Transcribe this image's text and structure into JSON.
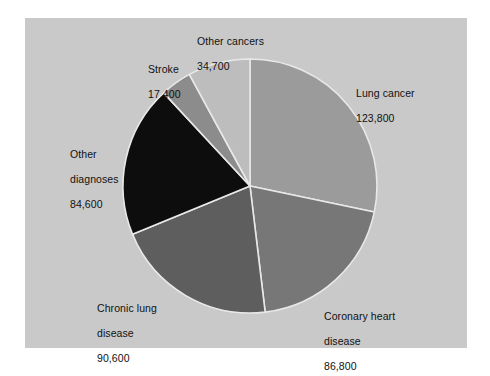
{
  "chart_data": {
    "type": "pie",
    "title": "",
    "subtitle": "",
    "xlabel": "",
    "ylabel": "",
    "legend_position": "none",
    "grid": false,
    "units": "deaths per year",
    "total": 437900,
    "categories": [
      "Lung cancer",
      "Coronary heart disease",
      "Chronic lung disease",
      "Other diagnoses",
      "Stroke",
      "Other cancers"
    ],
    "values": [
      123800,
      86800,
      90600,
      84600,
      17400,
      34700
    ],
    "value_labels": [
      "123,800",
      "86,800",
      "90,600",
      "84,600",
      "17,400",
      "34,700"
    ],
    "colors": [
      "#9b9b9b",
      "#777777",
      "#5e5e5e",
      "#0d0d0d",
      "#8c8c8c",
      "#bdbdbd"
    ],
    "start_angle_deg": 0,
    "direction": "clockwise",
    "slices": [
      {
        "name": "Lung cancer",
        "label": "Lung cancer",
        "value": 123800,
        "value_label": "123,800",
        "percent": 28.3,
        "color": "#9b9b9b"
      },
      {
        "name": "Coronary heart disease",
        "label": "Coronary heart\ndisease",
        "label_line1": "Coronary heart",
        "label_line2": "disease",
        "value": 86800,
        "value_label": "86,800",
        "percent": 19.8,
        "color": "#777777"
      },
      {
        "name": "Chronic lung disease",
        "label": "Chronic lung\ndisease",
        "label_line1": "Chronic lung",
        "label_line2": "disease",
        "value": 90600,
        "value_label": "90,600",
        "percent": 20.7,
        "color": "#5e5e5e"
      },
      {
        "name": "Other diagnoses",
        "label": "Other\ndiagnoses",
        "label_line1": "Other",
        "label_line2": "diagnoses",
        "value": 84600,
        "value_label": "84,600",
        "percent": 19.3,
        "color": "#0d0d0d"
      },
      {
        "name": "Stroke",
        "label": "Stroke",
        "value": 17400,
        "value_label": "17,400",
        "percent": 4.0,
        "color": "#8c8c8c"
      },
      {
        "name": "Other cancers",
        "label": "Other cancers",
        "value": 34700,
        "value_label": "34,700",
        "percent": 7.9,
        "color": "#bdbdbd"
      }
    ]
  },
  "figure": {
    "panel_color": "#c9c9c9",
    "page_color": "#ffffff",
    "slice_border_color": "#e8e8e8",
    "label_color": "#111111"
  },
  "labels": {
    "lung_cancer": {
      "name": "Lung cancer",
      "value": "123,800"
    },
    "coronary": {
      "line1": "Coronary heart",
      "line2": "disease",
      "value": "86,800"
    },
    "chronic": {
      "line1": "Chronic lung",
      "line2": "disease",
      "value": "90,600"
    },
    "other_diagnoses": {
      "line1": "Other",
      "line2": "diagnoses",
      "value": "84,600"
    },
    "stroke": {
      "name": "Stroke",
      "value": "17,400"
    },
    "other_cancers": {
      "name": "Other cancers",
      "value": "34,700"
    }
  }
}
